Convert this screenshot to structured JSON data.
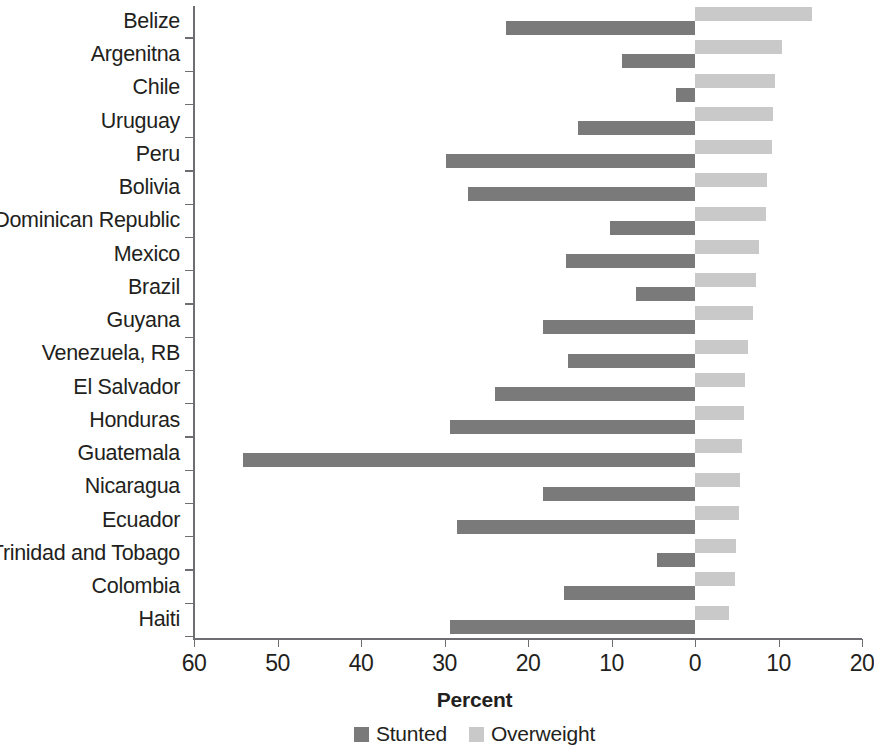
{
  "chart_data": {
    "type": "bar",
    "orientation": "horizontal-diverging",
    "title": "",
    "xlabel": "Percent",
    "ylabel": "",
    "grid": false,
    "legend_position": "bottom",
    "axis": {
      "left_max": 60,
      "right_max": 20,
      "tick_values": [
        60,
        50,
        40,
        30,
        20,
        10,
        0,
        10,
        20
      ],
      "tick_labels": [
        "60",
        "50",
        "40",
        "30",
        "20",
        "10",
        "0",
        "10",
        "20"
      ],
      "tick_signed": [
        -60,
        -50,
        -40,
        -30,
        -20,
        -10,
        0,
        10,
        20
      ]
    },
    "categories": [
      "Belize",
      "Argenitna",
      "Chile",
      "Uruguay",
      "Peru",
      "Bolivia",
      "Dominican Republic",
      "Mexico",
      "Brazil",
      "Guyana",
      "Venezuela, RB",
      "El Salvador",
      "Honduras",
      "Guatemala",
      "Nicaragua",
      "Ecuador",
      "Trinidad and Tobago",
      "Colombia",
      "Haiti"
    ],
    "series": [
      {
        "name": "Stunted",
        "color": "#7a7a7a",
        "direction": "left",
        "values": [
          22.6,
          8.7,
          2.3,
          14.0,
          29.8,
          27.2,
          10.2,
          15.4,
          7.1,
          18.2,
          15.2,
          24.0,
          29.4,
          54.1,
          18.2,
          28.5,
          4.6,
          15.7,
          29.3
        ]
      },
      {
        "name": "Overweight",
        "color": "#c9c9c9",
        "direction": "right",
        "values": [
          14.0,
          10.4,
          9.6,
          9.3,
          9.2,
          8.6,
          8.5,
          7.7,
          7.3,
          7.0,
          6.4,
          6.0,
          5.9,
          5.6,
          5.4,
          5.3,
          4.9,
          4.8,
          4.1
        ]
      }
    ]
  },
  "legend": {
    "items": [
      {
        "label": "Stunted",
        "color": "#7a7a7a"
      },
      {
        "label": "Overweight",
        "color": "#c9c9c9"
      }
    ]
  },
  "axis_title": "Percent"
}
